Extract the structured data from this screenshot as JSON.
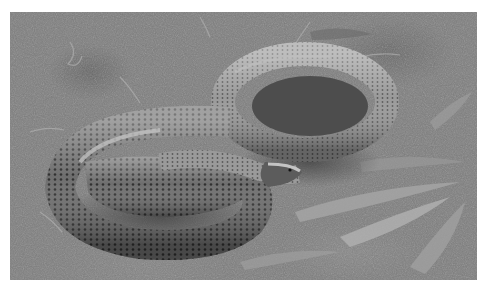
{
  "image": {
    "subject": "coiled snake on ground among grass and leaves",
    "tone": "grayscale",
    "colors": {
      "ground": "#7d7d7d",
      "snake_dark": "#3c3c3c",
      "snake_mid": "#6a6a6a",
      "snake_highlight": "#b4b4b4",
      "leaf_light": "#a8a8a8"
    }
  },
  "caption": {
    "text": ""
  }
}
